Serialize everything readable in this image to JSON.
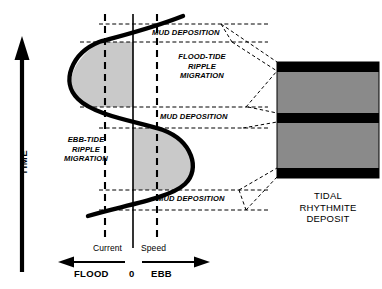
{
  "figure": {
    "type": "diagram"
  },
  "axes": {
    "time_label": "TIME",
    "x_caption_left": "Current",
    "x_caption_right": "Speed",
    "zero_label": "0",
    "flood_label": "FLOOD",
    "ebb_label": "EBB"
  },
  "curve": {
    "label": "current-speed-sine-curve",
    "description": "vertical sinusoid of current speed versus time"
  },
  "zones": {
    "flood_ripple": "FLOOD-TIDE\nRIPPLE\nMIGRATION",
    "flood_ripple_lines": [
      "FLOOD-TIDE",
      "RIPPLE",
      "MIGRATION"
    ],
    "ebb_ripple_lines": [
      "EBB-TIDE",
      "RIPPLE",
      "MIGRATION"
    ],
    "mud_top": "MUD DEPOSITION",
    "mud_middle": "MUD DEPOSITION",
    "mud_bottom": "MUD DEPOSITION"
  },
  "deposit": {
    "title_lines": [
      "TIDAL",
      "RHYTHMITE",
      "DEPOSIT"
    ],
    "layers": [
      {
        "name": "mud-layer-top",
        "material": "mud",
        "color": "#000000"
      },
      {
        "name": "sand-layer-upper",
        "material": "sand",
        "color": "#8a8a8a"
      },
      {
        "name": "mud-layer-middle",
        "material": "mud",
        "color": "#000000"
      },
      {
        "name": "sand-layer-lower",
        "material": "sand",
        "color": "#8a8a8a"
      },
      {
        "name": "mud-layer-bottom",
        "material": "mud",
        "color": "#000000"
      }
    ]
  },
  "colors": {
    "shade_fill": "#c9c9c9",
    "stroke": "#000000",
    "sand": "#8a8a8a",
    "mud": "#000000",
    "background": "#ffffff"
  }
}
